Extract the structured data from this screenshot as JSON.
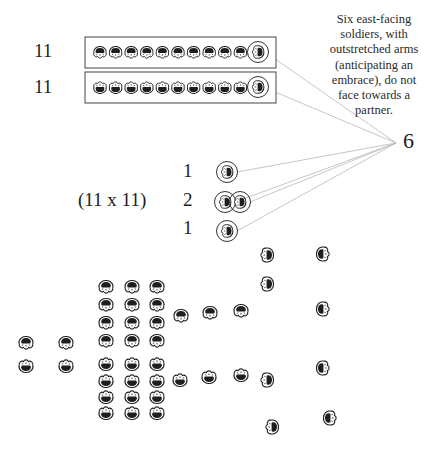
{
  "annotation": {
    "note_lines": [
      "Six east-facing",
      "soldiers, with",
      "outstretched arms",
      "(anticipating an",
      "embrace), do not",
      "face towards a",
      "partner."
    ],
    "count_label": "6",
    "convergence_point": [
      396,
      143
    ]
  },
  "ranks": [
    {
      "count_label": "11",
      "facing": "north",
      "box": [
        85,
        37,
        191,
        31
      ],
      "circled_unit": [
        258,
        52
      ]
    },
    {
      "count_label": "11",
      "facing": "south",
      "box": [
        85,
        72,
        191,
        31
      ],
      "circled_unit": [
        258,
        87
      ]
    }
  ],
  "center_group": {
    "formation_label": "(11 x 11)",
    "row_labels": [
      "1",
      "2",
      "1"
    ],
    "circled_units": [
      [
        227,
        172
      ],
      [
        225,
        202
      ],
      [
        240,
        202
      ],
      [
        227,
        231
      ]
    ]
  },
  "colors": {
    "ink": "#1e1e1e",
    "line": "#b8b8b8",
    "box": "#444444"
  },
  "field": {
    "north_block": {
      "cols": [
        106,
        132,
        157
      ],
      "rows": [
        287,
        305,
        323,
        341
      ],
      "facing": "north"
    },
    "south_block": {
      "cols": [
        106,
        132,
        157
      ],
      "rows": [
        364,
        381,
        397,
        413
      ],
      "facing": "south"
    },
    "singles": [
      {
        "x": 26,
        "y": 343,
        "facing": "north"
      },
      {
        "x": 66,
        "y": 343,
        "facing": "north"
      },
      {
        "x": 26,
        "y": 366,
        "facing": "south"
      },
      {
        "x": 66,
        "y": 366,
        "facing": "south"
      },
      {
        "x": 181,
        "y": 316,
        "facing": "north"
      },
      {
        "x": 210,
        "y": 313,
        "facing": "north"
      },
      {
        "x": 241,
        "y": 311,
        "facing": "north"
      },
      {
        "x": 180,
        "y": 380,
        "facing": "south"
      },
      {
        "x": 209,
        "y": 377,
        "facing": "south"
      },
      {
        "x": 241,
        "y": 375,
        "facing": "south"
      },
      {
        "x": 267,
        "y": 255,
        "facing": "east"
      },
      {
        "x": 267,
        "y": 284,
        "facing": "east"
      },
      {
        "x": 267,
        "y": 380,
        "facing": "east"
      },
      {
        "x": 272,
        "y": 427,
        "facing": "east"
      },
      {
        "x": 323,
        "y": 254,
        "facing": "west"
      },
      {
        "x": 323,
        "y": 309,
        "facing": "west"
      },
      {
        "x": 323,
        "y": 368,
        "facing": "west"
      },
      {
        "x": 330,
        "y": 418,
        "facing": "west"
      }
    ]
  }
}
